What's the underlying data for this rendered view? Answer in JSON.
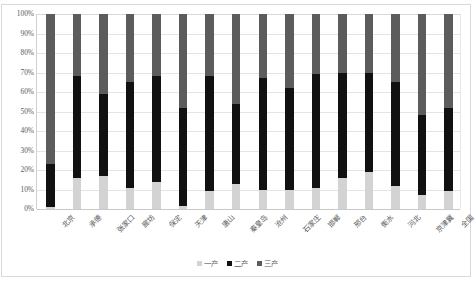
{
  "chart_data": {
    "type": "bar",
    "stacked": true,
    "normalized_percent": true,
    "title": "",
    "subtitle": "",
    "xlabel": "",
    "ylabel": "",
    "ylim": [
      0,
      100
    ],
    "ytick_labels": [
      "100%",
      "90%",
      "80%",
      "70%",
      "60%",
      "50%",
      "40%",
      "30%",
      "20%",
      "10%",
      "0%"
    ],
    "ytick_values": [
      100,
      90,
      80,
      70,
      60,
      50,
      40,
      30,
      20,
      10,
      0
    ],
    "grid": true,
    "legend_position": "bottom",
    "categories": [
      "北京",
      "承德",
      "张家口",
      "廊坊",
      "保定",
      "天津",
      "唐山",
      "秦皇岛",
      "沧州",
      "石家庄",
      "邯郸",
      "邢台",
      "衡水",
      "河北",
      "京津冀",
      "全国"
    ],
    "series": [
      {
        "name": "一产",
        "color": "#d3d3d3",
        "values": [
          1.0,
          16.0,
          17.0,
          11.0,
          14.0,
          1.5,
          9.0,
          13.0,
          10.0,
          10.0,
          11.0,
          16.0,
          19.0,
          12.0,
          7.0,
          9.0
        ]
      },
      {
        "name": "二产",
        "color": "#111111",
        "values": [
          22.0,
          52.0,
          42.0,
          54.0,
          54.0,
          50.5,
          59.0,
          41.0,
          57.0,
          52.0,
          58.0,
          54.0,
          51.0,
          53.0,
          41.0,
          43.0
        ]
      },
      {
        "name": "三产",
        "color": "#5c5c5c",
        "values": [
          77.0,
          32.0,
          41.0,
          35.0,
          32.0,
          48.0,
          32.0,
          46.0,
          33.0,
          38.0,
          31.0,
          30.0,
          30.0,
          35.0,
          52.0,
          48.0
        ]
      }
    ],
    "cumulative_tops": {
      "一产": [
        1.0,
        16.0,
        17.0,
        11.0,
        14.0,
        1.5,
        9.0,
        13.0,
        10.0,
        10.0,
        11.0,
        16.0,
        19.0,
        12.0,
        7.0,
        9.0
      ],
      "二产": [
        23.0,
        68.0,
        59.0,
        65.0,
        68.0,
        52.0,
        68.0,
        54.0,
        67.0,
        62.0,
        69.0,
        70.0,
        70.0,
        65.0,
        48.0,
        52.0
      ],
      "三产": [
        100,
        100,
        100,
        100,
        100,
        100,
        100,
        100,
        100,
        100,
        100,
        100,
        100,
        100,
        100,
        100
      ]
    }
  },
  "legend": {
    "items": [
      {
        "label": "一产",
        "color": "#d3d3d3"
      },
      {
        "label": "二产",
        "color": "#111111"
      },
      {
        "label": "三产",
        "color": "#5c5c5c"
      }
    ]
  },
  "colors": {
    "primary_industry": "#d3d3d3",
    "secondary_industry": "#111111",
    "tertiary_industry": "#5c5c5c",
    "gridline": "#e4e4e4",
    "frame": "#d9d9d9",
    "text": "#5a5a5a",
    "background": "#ffffff"
  }
}
